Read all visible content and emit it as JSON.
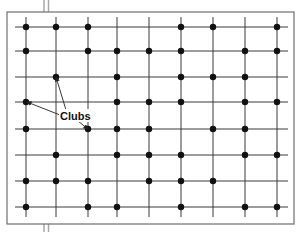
{
  "diagram": {
    "type": "grid-of-clubs",
    "width": 306,
    "height": 232,
    "colors": {
      "background": "#ffffff",
      "frame": "#6e6e6e",
      "grid_line": "#3a3a3a",
      "club_dot": "#111111",
      "label": "#111111",
      "tick_marks": "#a8a8a8"
    },
    "frame": {
      "x": 7,
      "y": 12,
      "width": 287,
      "height": 212
    },
    "top_marks": {
      "x": [
        44,
        48.5
      ],
      "y1": 0,
      "y2": 12
    },
    "bottom_marks": {
      "x": [
        44,
        48.5
      ],
      "y1": 224,
      "y2": 232
    },
    "vertical_lines": {
      "x": [
        26,
        56,
        88,
        117,
        149,
        181,
        213,
        245,
        277
      ],
      "y1": 17,
      "y2": 217
    },
    "horizontal_lines": {
      "y": [
        27,
        51,
        77,
        102,
        129,
        155,
        181,
        207
      ],
      "x1": 15,
      "x2": 288
    },
    "clubs_by_row": [
      {
        "y": 27,
        "x": [
          26,
          56,
          88,
          181,
          213,
          277
        ]
      },
      {
        "y": 51,
        "x": [
          26,
          88,
          117,
          149,
          181,
          245,
          277
        ]
      },
      {
        "y": 77,
        "x": [
          56,
          117,
          181,
          213,
          245
        ]
      },
      {
        "y": 102,
        "x": [
          26,
          117,
          149,
          181,
          245,
          277
        ]
      },
      {
        "y": 129,
        "x": [
          26,
          88,
          117,
          149,
          213,
          245
        ]
      },
      {
        "y": 155,
        "x": [
          56,
          117,
          149,
          181,
          245,
          277
        ]
      },
      {
        "y": 181,
        "x": [
          26,
          56,
          88,
          149,
          181,
          213
        ]
      },
      {
        "y": 207,
        "x": [
          26,
          88,
          117,
          181,
          245,
          277
        ]
      }
    ],
    "label": {
      "text": "Clubs",
      "x": 60,
      "y": 120,
      "box": {
        "x": 59,
        "y": 109,
        "width": 30,
        "height": 13
      }
    },
    "arrows": [
      {
        "from": [
          66,
          110
        ],
        "to": [
          56,
          77
        ]
      },
      {
        "from": [
          60,
          115
        ],
        "to": [
          27,
          102
        ]
      },
      {
        "from": [
          78,
          121
        ],
        "to": [
          88,
          129
        ]
      }
    ]
  }
}
